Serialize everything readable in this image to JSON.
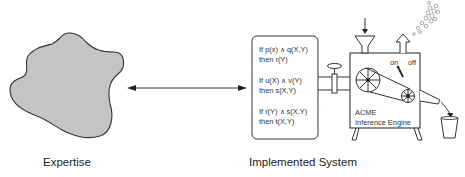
{
  "labels": {
    "expertise": "Expertise",
    "implemented_system": "Implemented System"
  },
  "rules": [
    {
      "if": "If p(x) ∧ q(X,Y)",
      "then": "then r(Y)"
    },
    {
      "if": "If u(X) ∧ v(Y)",
      "then": "then s(X,Y)"
    },
    {
      "if": "If r(Y) ∧ s(X,Y)",
      "then": "then t(X,Y)"
    }
  ],
  "engine": {
    "brand": "ACME",
    "name": "Inference Engine",
    "switch_on": "on",
    "switch_off": "off"
  },
  "colors": {
    "blob_fill": "#c4c4c4",
    "stroke": "#333333",
    "text": "#222222"
  }
}
